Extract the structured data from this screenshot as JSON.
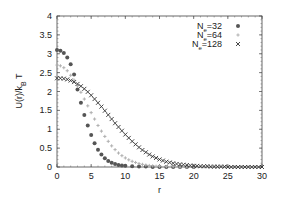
{
  "chart_data": {
    "type": "scatter",
    "title": "",
    "xlabel": "r",
    "ylabel": "U(r)/k_B T",
    "xlim": [
      0,
      30
    ],
    "ylim": [
      0,
      4
    ],
    "xticks": [
      0,
      5,
      10,
      15,
      20,
      25,
      30
    ],
    "yticks": [
      0,
      0.5,
      1,
      1.5,
      2,
      2.5,
      3,
      3.5,
      4
    ],
    "ytick_labels": [
      "0",
      "0.5",
      "1",
      "1.5",
      "2",
      "2.5",
      "3",
      "3.5",
      "4"
    ],
    "xtick_labels": [
      "0",
      "5",
      "10",
      "15",
      "20",
      "25",
      "30"
    ],
    "grid": false,
    "legend_position": "top-right",
    "series": [
      {
        "name": "N_e=32",
        "label_main": "N",
        "label_sub": "e",
        "label_rest": "=32",
        "marker": "filled-circle",
        "color": "#555555",
        "x": [
          0,
          0.5,
          1,
          1.5,
          2,
          2.5,
          3,
          3.5,
          4,
          4.5,
          5,
          5.5,
          6,
          6.5,
          7,
          7.5,
          8,
          8.5,
          9,
          9.5,
          10,
          11,
          12,
          13,
          14,
          15,
          16,
          17,
          18,
          19,
          20
        ],
        "y": [
          3.1,
          3.08,
          3.02,
          2.9,
          2.72,
          2.45,
          2.05,
          1.7,
          1.38,
          1.1,
          0.85,
          0.63,
          0.46,
          0.33,
          0.23,
          0.16,
          0.11,
          0.08,
          0.05,
          0.04,
          0.03,
          0.02,
          0.01,
          0.01,
          0.0,
          0.0,
          0.0,
          0.0,
          0.0,
          0.0,
          0.0
        ]
      },
      {
        "name": "N_e=64",
        "label_main": "N",
        "label_sub": "e",
        "label_rest": "=64",
        "marker": "plus",
        "color": "#b0b0b0",
        "x": [
          0,
          0.5,
          1,
          1.5,
          2,
          2.5,
          3,
          3.5,
          4,
          4.5,
          5,
          5.5,
          6,
          6.5,
          7,
          7.5,
          8,
          8.5,
          9,
          9.5,
          10,
          10.5,
          11,
          11.5,
          12,
          12.5,
          13,
          13.5,
          14,
          14.5,
          15,
          16,
          17,
          18,
          19,
          20
        ],
        "y": [
          2.7,
          2.68,
          2.63,
          2.55,
          2.43,
          2.3,
          2.15,
          1.98,
          1.8,
          1.62,
          1.44,
          1.27,
          1.1,
          0.95,
          0.81,
          0.68,
          0.56,
          0.46,
          0.37,
          0.3,
          0.24,
          0.19,
          0.15,
          0.12,
          0.09,
          0.07,
          0.05,
          0.04,
          0.03,
          0.02,
          0.02,
          0.01,
          0.01,
          0.0,
          0.0,
          0.0
        ]
      },
      {
        "name": "N_e=128",
        "label_main": "N",
        "label_sub": "e",
        "label_rest": "=128",
        "marker": "cross",
        "color": "#333333",
        "x": [
          0,
          0.5,
          1,
          1.5,
          2,
          2.5,
          3,
          3.5,
          4,
          4.5,
          5,
          5.5,
          6,
          6.5,
          7,
          7.5,
          8,
          8.5,
          9,
          9.5,
          10,
          10.5,
          11,
          11.5,
          12,
          12.5,
          13,
          13.5,
          14,
          14.5,
          15,
          15.5,
          16,
          16.5,
          17,
          17.5,
          18,
          18.5,
          19,
          19.5,
          20,
          20.5,
          21,
          21.5,
          22,
          22.5,
          23,
          23.5,
          24,
          24.5,
          25,
          25.5,
          26,
          26.5,
          27,
          27.5,
          28,
          28.5,
          29,
          29.5,
          30
        ],
        "y": [
          2.35,
          2.35,
          2.34,
          2.32,
          2.29,
          2.25,
          2.2,
          2.14,
          2.07,
          1.99,
          1.9,
          1.8,
          1.7,
          1.6,
          1.49,
          1.38,
          1.27,
          1.16,
          1.06,
          0.96,
          0.86,
          0.77,
          0.68,
          0.6,
          0.52,
          0.45,
          0.39,
          0.33,
          0.28,
          0.24,
          0.2,
          0.17,
          0.14,
          0.12,
          0.1,
          0.08,
          0.07,
          0.06,
          0.05,
          0.04,
          0.03,
          0.03,
          0.02,
          0.02,
          0.02,
          0.01,
          0.01,
          0.01,
          0.01,
          0.01,
          0.0,
          0.0,
          0.0,
          0.0,
          0.0,
          0.0,
          0.0,
          0.0,
          0.0,
          0.0,
          0.0
        ]
      }
    ]
  },
  "layout": {
    "plot": {
      "left": 57,
      "top": 16,
      "right": 262,
      "bottom": 167
    }
  }
}
